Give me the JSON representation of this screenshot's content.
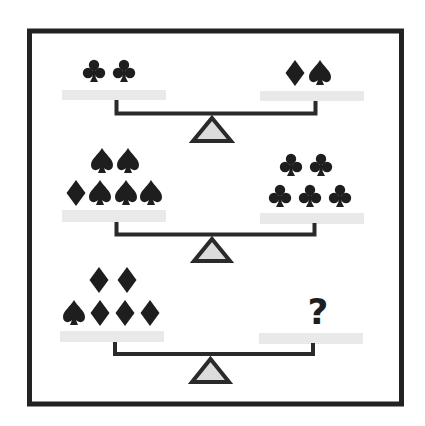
{
  "puzzle": {
    "type": "balance-scale-symbol-puzzle",
    "colors": {
      "frame": "#222222",
      "symbol": "#1e1e1e",
      "pan": "#e9e9e9",
      "beam": "#2a2a2a",
      "fulcrum_fill": "#dcdcdc"
    },
    "scales": [
      {
        "id": "scale-1",
        "left": {
          "rows": [
            [
              "club",
              "club"
            ]
          ]
        },
        "right": {
          "rows": [
            [
              "diamond",
              "spade"
            ]
          ]
        }
      },
      {
        "id": "scale-2",
        "left": {
          "rows": [
            [
              "spade",
              "spade"
            ],
            [
              "diamond",
              "spade",
              "spade",
              "spade"
            ]
          ]
        },
        "right": {
          "rows": [
            [
              "club",
              "club"
            ],
            [
              "club",
              "club",
              "club"
            ]
          ]
        }
      },
      {
        "id": "scale-3",
        "left": {
          "rows": [
            [
              "diamond",
              "diamond"
            ],
            [
              "spade",
              "diamond",
              "diamond",
              "diamond"
            ]
          ]
        },
        "right": {
          "unknown": "?"
        }
      }
    ]
  }
}
